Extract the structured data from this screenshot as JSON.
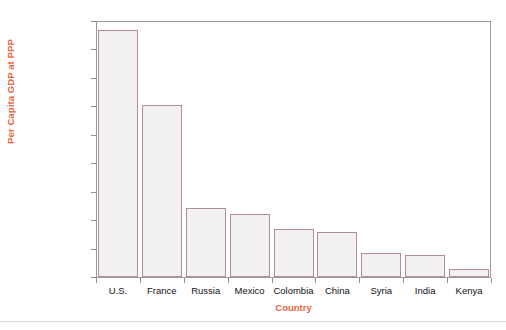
{
  "chart_data": {
    "type": "bar",
    "title": "",
    "xlabel": "Country",
    "ylabel": "Per Capita GDP at PPP",
    "categories": [
      "U.S.",
      "France",
      "Russia",
      "Mexico",
      "Colombia",
      "China",
      "Syria",
      "India",
      "Kenya"
    ],
    "values": [
      43500,
      30200,
      12100,
      11100,
      8500,
      7900,
      4200,
      3900,
      1400
    ],
    "ylim": [
      0,
      45000
    ],
    "ytick_values": [
      0,
      5000,
      10000,
      15000,
      20000,
      25000,
      30000,
      35000,
      40000,
      45000
    ],
    "ytick_labels": [
      "0",
      "5,000",
      "10,000",
      "15,000",
      "20,000",
      "25,000",
      "30,000",
      "35,000",
      "40,000",
      "$45,000"
    ],
    "grid": false,
    "legend": null,
    "colors": {
      "bar_fill": "#f2f0f3",
      "bar_border": "#b58e95",
      "axis_title": "#e8643c",
      "axis_line": "#9a9a9a",
      "tick_label": "#111111",
      "background": "#ffffff"
    }
  },
  "figure": {
    "y_axis_title": "Per Capita GDP at PPP",
    "x_axis_title": "Country"
  }
}
